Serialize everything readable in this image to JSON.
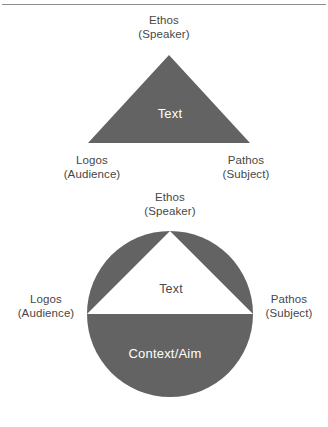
{
  "figure": {
    "background_color": "#ffffff",
    "shape_fill_color": "#636363",
    "label_color": "#474747",
    "inner_label_color": "#ffffff",
    "rule_color": "#8e8e8e"
  },
  "diagrams": [
    {
      "name": "rhetorical-triangle",
      "shape": "triangle",
      "apex_label": {
        "title": "Ethos",
        "subtitle": "(Speaker)"
      },
      "left_label": {
        "title": "Logos",
        "subtitle": "(Audience)"
      },
      "right_label": {
        "title": "Pathos",
        "subtitle": "(Subject)"
      },
      "center_label": "Text"
    },
    {
      "name": "rhetorical-triangle-in-context-circle",
      "shape": "circle-with-inscribed-triangle",
      "apex_label": {
        "title": "Ethos",
        "subtitle": "(Speaker)"
      },
      "left_label": {
        "title": "Logos",
        "subtitle": "(Audience)"
      },
      "right_label": {
        "title": "Pathos",
        "subtitle": "(Subject)"
      },
      "center_label": "Text",
      "lower_region_label": "Context/Aim"
    }
  ]
}
